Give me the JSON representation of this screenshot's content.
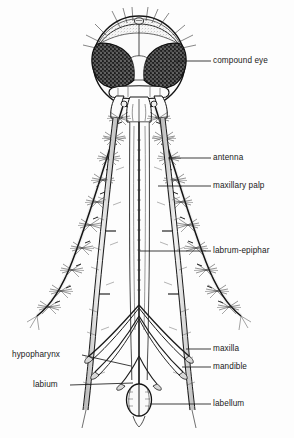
{
  "figure": {
    "background_color": "#fdfdfd",
    "ink_color": "#1a1a1a"
  },
  "labels": [
    {
      "id": "compound-eye",
      "text": "compound eye",
      "side": "right",
      "x": 213,
      "y": 56,
      "leader": {
        "x1": 176,
        "y1": 61,
        "x2": 211,
        "y2": 61
      }
    },
    {
      "id": "antenna",
      "text": "antenna",
      "side": "right",
      "x": 213,
      "y": 153,
      "leader": {
        "x1": 168,
        "y1": 158,
        "x2": 211,
        "y2": 158
      }
    },
    {
      "id": "maxillary-palp",
      "text": "maxillary palp",
      "side": "right",
      "x": 213,
      "y": 181,
      "leader": {
        "x1": 158,
        "y1": 186,
        "x2": 211,
        "y2": 186
      }
    },
    {
      "id": "labrum-epiphar",
      "text": "labrum-epiphar",
      "side": "right",
      "x": 213,
      "y": 246,
      "leader": {
        "x1": 140,
        "y1": 251,
        "x2": 211,
        "y2": 251
      }
    },
    {
      "id": "maxilla",
      "text": "maxilla",
      "side": "right",
      "x": 213,
      "y": 344,
      "leader": {
        "x1": 186,
        "y1": 349,
        "x2": 211,
        "y2": 349
      }
    },
    {
      "id": "mandible",
      "text": "mandible",
      "side": "right",
      "x": 213,
      "y": 362,
      "leader": {
        "x1": 182,
        "y1": 367,
        "x2": 211,
        "y2": 367
      }
    },
    {
      "id": "labellum",
      "text": "labellum",
      "side": "right",
      "x": 213,
      "y": 399,
      "leader": {
        "x1": 150,
        "y1": 404,
        "x2": 211,
        "y2": 404
      }
    },
    {
      "id": "hypopharynx",
      "text": "hypopharynx",
      "side": "left",
      "x": 12,
      "y": 350,
      "leader": {
        "x1": 82,
        "y1": 355,
        "x2": 131,
        "y2": 366
      }
    },
    {
      "id": "labium",
      "text": "labium",
      "side": "left",
      "x": 33,
      "y": 380,
      "leader": {
        "x1": 70,
        "y1": 385,
        "x2": 133,
        "y2": 383
      }
    }
  ]
}
